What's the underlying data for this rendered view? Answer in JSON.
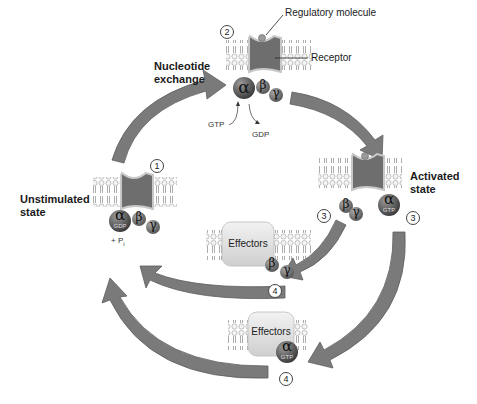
{
  "labels": {
    "regulatory_molecule": "Regulatory molecule",
    "receptor": "Receptor",
    "nucleotide_exchange_line1": "Nucleotide",
    "nucleotide_exchange_line2": "exchange",
    "unstimulated_line1": "Unstimulated",
    "unstimulated_line2": "state",
    "activated_line1": "Activated",
    "activated_line2": "state",
    "gtp": "GTP",
    "gdp": "GDP",
    "pi": "+ P",
    "pi_sub": "i",
    "effectors": "Effectors"
  },
  "steps": {
    "s1": "1",
    "s2": "2",
    "s3a": "3",
    "s3b": "3",
    "s4a": "4",
    "s4b": "4"
  },
  "subunits": {
    "alpha": "α",
    "beta": "β",
    "gamma": "γ",
    "gdp_tag": "GDP",
    "gtp_tag": "GTP"
  },
  "colors": {
    "arrow": "#7a7a7a",
    "arrow_edge": "#5a5a5a",
    "membrane": "#d8d8d8",
    "receptor": "#6e6e6e",
    "alpha": "#555555",
    "beta": "#6a6a6a",
    "effector_box": "#e2e2e2"
  }
}
